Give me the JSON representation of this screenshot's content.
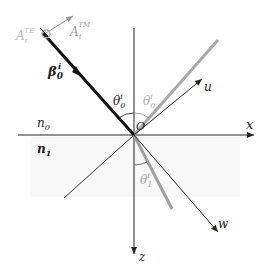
{
  "figure": {
    "type": "reflection-refraction-diagram",
    "origin_label": "O",
    "axes": {
      "x_label": "x",
      "z_label": "z"
    },
    "media": {
      "upper": "n",
      "upper_sub": "0",
      "lower": "n",
      "lower_sub": "1"
    },
    "vectors": {
      "incident_beta": "β",
      "incident_beta_sup": "i",
      "incident_beta_sub": "0",
      "A_TE": "A",
      "A_TE_sup": "TE",
      "A_TE_sub": "i",
      "A_TM": "A",
      "A_TM_sup": "TM",
      "A_TM_sub": "i",
      "u_label": "u",
      "w_label": "w"
    },
    "angles": {
      "incident": "θ",
      "incident_sub": "0",
      "incident_sup": "i",
      "reflected": "θ",
      "reflected_sub": "0",
      "reflected_sup": "i",
      "refracted": "θ",
      "refracted_sub": "1",
      "refracted_sup": "i"
    },
    "colors": {
      "incident_beam": "#111111",
      "reflected_beam": "#a8a8a8",
      "refracted_beam": "#a0a0a0",
      "axes": "#222222",
      "gray_label": "#b0b0b0",
      "lower_medium_tint": "#f7f7f7"
    }
  }
}
